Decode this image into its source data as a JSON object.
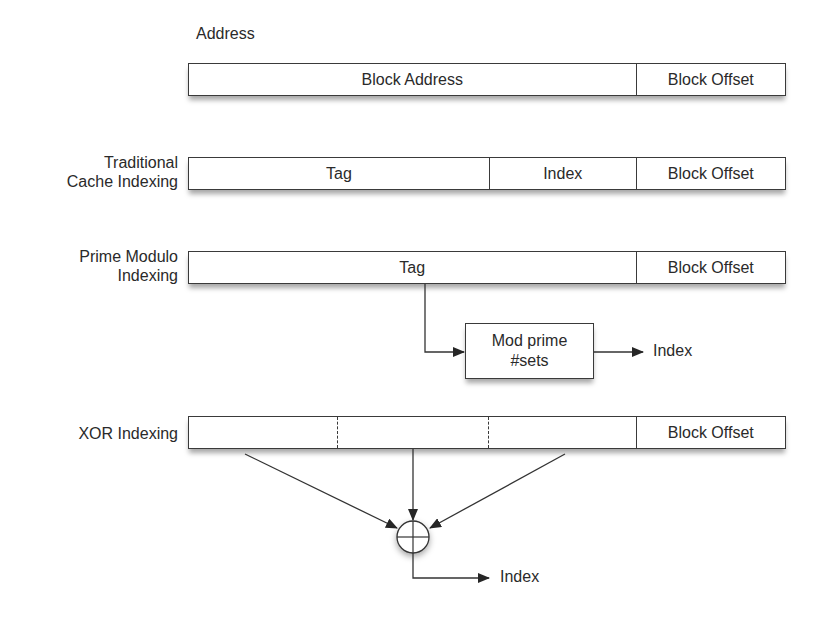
{
  "diagram": {
    "title": "Address",
    "rows": [
      {
        "label_lines": [
          "",
          ""
        ],
        "segments": [
          {
            "label": "Block Address",
            "width": 449,
            "divider": "solid"
          },
          {
            "label": "Block Offset",
            "width": 149,
            "divider": "none"
          }
        ]
      },
      {
        "label_lines": [
          "Traditional",
          "Cache Indexing"
        ],
        "segments": [
          {
            "label": "Tag",
            "width": 302,
            "divider": "solid"
          },
          {
            "label": "Index",
            "width": 147,
            "divider": "solid"
          },
          {
            "label": "Block Offset",
            "width": 149,
            "divider": "none"
          }
        ]
      },
      {
        "label_lines": [
          "Prime Modulo",
          "Indexing"
        ],
        "segments": [
          {
            "label": "Tag",
            "width": 449,
            "divider": "solid"
          },
          {
            "label": "Block Offset",
            "width": 149,
            "divider": "none"
          }
        ]
      },
      {
        "label_lines": [
          "XOR Indexing"
        ],
        "segments": [
          {
            "label": "",
            "width": 149,
            "divider": "dashed"
          },
          {
            "label": "",
            "width": 152,
            "divider": "dashed"
          },
          {
            "label": "",
            "width": 148,
            "divider": "solid"
          },
          {
            "label": "Block Offset",
            "width": 149,
            "divider": "none"
          }
        ]
      }
    ],
    "mod_box": {
      "line1": "Mod prime",
      "line2": "#sets"
    },
    "prime_output_label": "Index",
    "xor_operator": "⊕",
    "xor_output_label": "Index"
  }
}
